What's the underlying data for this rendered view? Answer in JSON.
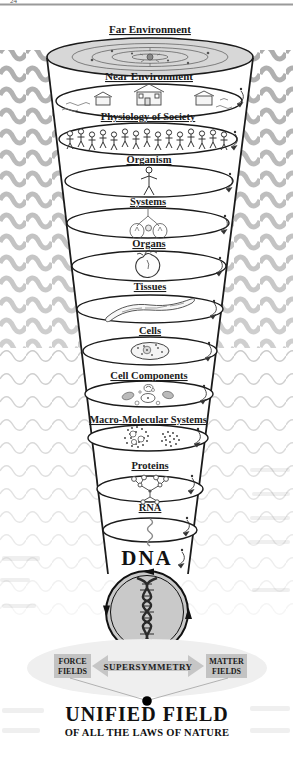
{
  "page": {
    "number": "24"
  },
  "funnel": {
    "levels": [
      {
        "label": "Far Environment",
        "icon": "solar-system-icon"
      },
      {
        "label": "Near Environment",
        "icon": "houses-icon"
      },
      {
        "label": "Physiology of Society",
        "icon": "people-row-icon"
      },
      {
        "label": "Organism",
        "icon": "human-figure-icon"
      },
      {
        "label": "Systems",
        "icon": "body-systems-icon"
      },
      {
        "label": "Organs",
        "icon": "heart-organ-icon"
      },
      {
        "label": "Tissues",
        "icon": "tissue-strip-icon"
      },
      {
        "label": "Cells",
        "icon": "cell-icon"
      },
      {
        "label": "Cell Components",
        "icon": "organelles-icon"
      },
      {
        "label": "Macro-Molecular Systems",
        "icon": "molecule-clusters-icon"
      },
      {
        "label": "Proteins",
        "icon": "protein-molecule-icon"
      },
      {
        "label": "RNA",
        "icon": "rna-strand-icon"
      },
      {
        "label": "DNA",
        "icon": "dna-helix-icon"
      }
    ]
  },
  "foundation": {
    "force_line1": "FORCE",
    "force_line2": "FIELDS",
    "supersymmetry": "SUPERSYMMETRY",
    "matter_line1": "MATTER",
    "matter_line2": "FIELDS",
    "title": "UNIFIED FIELD",
    "subtitle": "OF ALL THE LAWS OF NATURE"
  },
  "colors": {
    "wave": "#a9a9a9",
    "top_disc_fill": "#d7d7d7",
    "dna_circle_fill": "#c9c9c9",
    "field_box_fill": "#c3c3c3",
    "ink": "#1b1b1b"
  }
}
